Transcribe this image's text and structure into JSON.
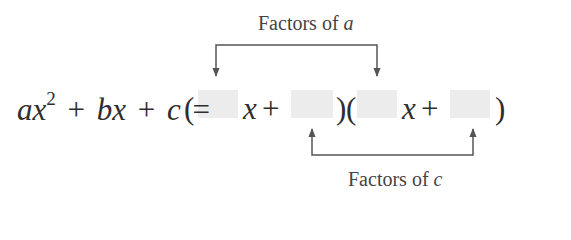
{
  "diagram": {
    "top_label": {
      "prefix": "Factors of ",
      "variable": "a"
    },
    "bottom_label": {
      "prefix": "Factors of ",
      "variable": "c"
    },
    "equation": {
      "lhs": {
        "a": "a",
        "x": "x",
        "exp": "2",
        "plus1": "+",
        "b": "b",
        "x2": "x",
        "plus2": "+",
        "c": "c"
      },
      "equals": "=",
      "rhs": {
        "open1": "(",
        "x1": "x",
        "plus1": "+",
        "close1": ")",
        "open2": "(",
        "x2": "x",
        "plus2": "+",
        "close2": ")"
      },
      "blank_boxes": 4
    },
    "colors": {
      "text": "#333333",
      "arrow": "#555555",
      "blank": "#ececec"
    }
  }
}
